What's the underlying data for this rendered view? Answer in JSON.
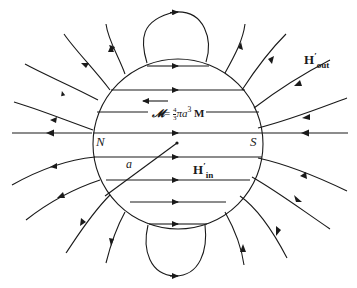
{
  "figure": {
    "type": "magnetic-field-lines-of-uniformly-magnetized-sphere",
    "colors": {
      "line": "#1a1a1a",
      "background": "#ffffff"
    },
    "labels": {
      "north_pole": "N",
      "south_pole": "S",
      "radius": "a",
      "h_out": {
        "base": "H",
        "prime": "′",
        "sub": "out"
      },
      "h_in": {
        "base": "H",
        "prime": "′",
        "sub": "in"
      },
      "moment": {
        "symbol": "𝓜",
        "equals": "= ",
        "frac_num": "4",
        "frac_den": "3",
        "pi": "π",
        "a": "a",
        "exp": "3",
        "M": " M"
      }
    },
    "arrows": {
      "moment_direction": "left",
      "interior_field_direction": "right",
      "exterior_field": "from S around to N"
    }
  }
}
